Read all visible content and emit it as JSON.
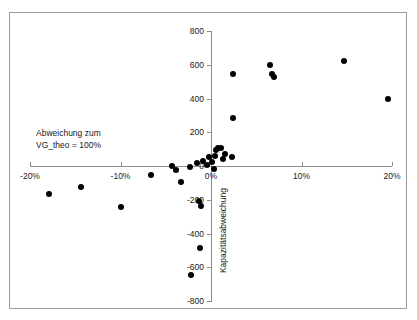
{
  "chart_data": {
    "type": "scatter",
    "title": "",
    "xlabel": "Abweichung zum VG_theo = 100%",
    "ylabel": "Kapazitätsabweichung",
    "xlim": [
      -20,
      20
    ],
    "ylim": [
      -800,
      800
    ],
    "x_ticks": [
      -20,
      -10,
      0,
      10,
      20
    ],
    "x_tick_labels": [
      "-20%",
      "-10%",
      "0%",
      "10%",
      "20%"
    ],
    "y_ticks": [
      -800,
      -600,
      -400,
      -200,
      0,
      200,
      400,
      600,
      800
    ],
    "y_tick_labels": [
      "-800",
      "-600",
      "-400",
      "-200",
      "0",
      "200",
      "400",
      "600",
      "800"
    ],
    "grid": false,
    "legend": null,
    "marker": {
      "shape": "circle",
      "color": "#000000",
      "size": 6
    },
    "annotations": [
      {
        "text": "Abweichung zum",
        "x": -19.3,
        "y": 230
      },
      {
        "text": "VG_theo = 100%",
        "x": -19.3,
        "y": 160
      }
    ],
    "points": [
      {
        "x": -17.9,
        "y": -165
      },
      {
        "x": -14.4,
        "y": -125
      },
      {
        "x": -9.9,
        "y": -245
      },
      {
        "x": -6.6,
        "y": -53
      },
      {
        "x": -4.3,
        "y": -2
      },
      {
        "x": -3.9,
        "y": -24
      },
      {
        "x": -3.3,
        "y": -95
      },
      {
        "x": -2.3,
        "y": -6
      },
      {
        "x": -1.5,
        "y": 18
      },
      {
        "x": -1.3,
        "y": -205
      },
      {
        "x": -1.1,
        "y": -237
      },
      {
        "x": -1.2,
        "y": -485
      },
      {
        "x": -2.2,
        "y": -645
      },
      {
        "x": -0.9,
        "y": 30
      },
      {
        "x": -0.4,
        "y": 8
      },
      {
        "x": -0.2,
        "y": 52
      },
      {
        "x": 0.1,
        "y": 25
      },
      {
        "x": 0.3,
        "y": -15
      },
      {
        "x": 0.4,
        "y": 62
      },
      {
        "x": 0.6,
        "y": 95
      },
      {
        "x": 0.8,
        "y": 108
      },
      {
        "x": 1.1,
        "y": 104
      },
      {
        "x": 1.3,
        "y": 40
      },
      {
        "x": 1.6,
        "y": 72
      },
      {
        "x": 2.3,
        "y": 55
      },
      {
        "x": 2.4,
        "y": 283
      },
      {
        "x": 2.4,
        "y": 545
      },
      {
        "x": 6.5,
        "y": 600
      },
      {
        "x": 6.7,
        "y": 545
      },
      {
        "x": 7.0,
        "y": 530
      },
      {
        "x": 14.7,
        "y": 620
      },
      {
        "x": 19.6,
        "y": 400
      }
    ]
  }
}
